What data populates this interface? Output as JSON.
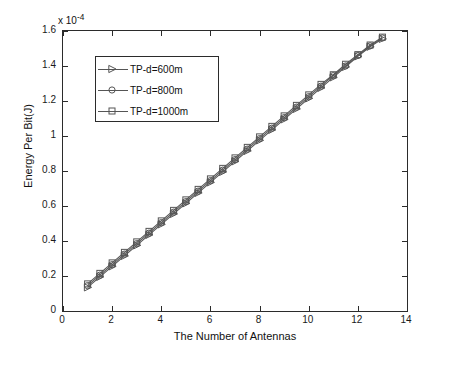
{
  "chart_data": {
    "type": "line",
    "title": "",
    "xlabel": "The Number of Antennas",
    "ylabel": "Energy Per Bit(J)",
    "y_exponent_label": "x 10",
    "y_exponent_value": "-4",
    "xlim": [
      0,
      14
    ],
    "ylim": [
      0,
      1.6
    ],
    "xticks": [
      0,
      2,
      4,
      6,
      8,
      10,
      12,
      14
    ],
    "xticklabels": [
      "0",
      "2",
      "4",
      "6",
      "8",
      "10",
      "12",
      "14"
    ],
    "yticks": [
      0,
      0.2,
      0.4,
      0.6,
      0.8,
      1.0,
      1.2,
      1.4,
      1.6
    ],
    "yticklabels": [
      "0",
      "0.2",
      "0.4",
      "0.6",
      "0.8",
      "1",
      "1.2",
      "1.4",
      "1.6"
    ],
    "grid": false,
    "legend_position": "upper-left-inside",
    "x": [
      1,
      1.5,
      2,
      2.5,
      3,
      3.5,
      4,
      4.5,
      5,
      5.5,
      6,
      6.5,
      7,
      7.5,
      8,
      8.5,
      9,
      9.5,
      10,
      10.5,
      11,
      11.5,
      12,
      12.5,
      13
    ],
    "series": [
      {
        "name": "TP-d=600m",
        "marker": "triangle-right",
        "color": "#555555",
        "values": [
          0.135,
          0.195,
          0.255,
          0.315,
          0.375,
          0.435,
          0.495,
          0.555,
          0.615,
          0.675,
          0.735,
          0.795,
          0.855,
          0.915,
          0.975,
          1.035,
          1.095,
          1.155,
          1.215,
          1.275,
          1.335,
          1.395,
          1.455,
          1.51,
          1.555
        ]
      },
      {
        "name": "TP-d=800m",
        "marker": "circle",
        "color": "#555555",
        "values": [
          0.145,
          0.205,
          0.265,
          0.325,
          0.385,
          0.445,
          0.505,
          0.565,
          0.625,
          0.685,
          0.745,
          0.805,
          0.865,
          0.925,
          0.985,
          1.045,
          1.105,
          1.165,
          1.225,
          1.285,
          1.345,
          1.4,
          1.46,
          1.515,
          1.56
        ]
      },
      {
        "name": "TP-d=1000m",
        "marker": "square",
        "color": "#555555",
        "values": [
          0.155,
          0.215,
          0.275,
          0.335,
          0.395,
          0.455,
          0.515,
          0.575,
          0.635,
          0.695,
          0.755,
          0.815,
          0.875,
          0.935,
          0.995,
          1.055,
          1.115,
          1.175,
          1.235,
          1.295,
          1.35,
          1.41,
          1.465,
          1.52,
          1.565
        ]
      }
    ]
  },
  "legend": {
    "items": [
      {
        "label": "TP-d=600m",
        "marker": "triangle-right-marker"
      },
      {
        "label": "TP-d=800m",
        "marker": "circle-marker"
      },
      {
        "label": "TP-d=1000m",
        "marker": "square-marker"
      }
    ]
  }
}
